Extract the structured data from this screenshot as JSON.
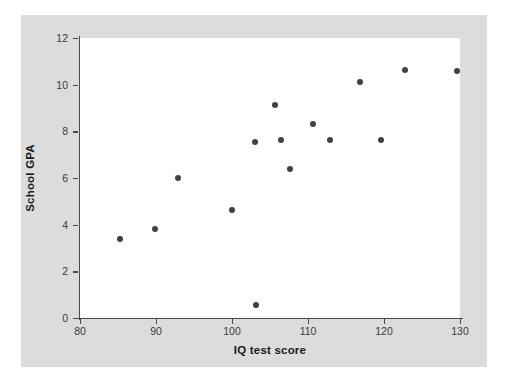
{
  "chart_data": {
    "type": "scatter",
    "title": "",
    "xlabel": "IQ test score",
    "ylabel": "School GPA",
    "xlim": [
      80,
      130
    ],
    "ylim": [
      0,
      12
    ],
    "xticks": [
      80,
      90,
      100,
      110,
      120,
      130
    ],
    "yticks": [
      0,
      2,
      4,
      6,
      8,
      10,
      12
    ],
    "xtick_labels": [
      "80",
      "90",
      "100",
      "110",
      "120",
      "130"
    ],
    "ytick_labels": [
      "0",
      "2",
      "4",
      "6",
      "8",
      "10",
      "12"
    ],
    "grid": false,
    "legend": null,
    "marker_color": "#414141",
    "panel_color": "#ffffff",
    "background_color": "#dcdcdc",
    "axis_color": "#4a4a4a",
    "points": [
      {
        "x": 85.3,
        "y": 3.4
      },
      {
        "x": 89.9,
        "y": 3.8
      },
      {
        "x": 92.9,
        "y": 6.0
      },
      {
        "x": 100.0,
        "y": 4.65
      },
      {
        "x": 103.0,
        "y": 7.55
      },
      {
        "x": 103.1,
        "y": 0.55
      },
      {
        "x": 105.7,
        "y": 9.15
      },
      {
        "x": 106.5,
        "y": 7.65
      },
      {
        "x": 107.6,
        "y": 6.4
      },
      {
        "x": 110.7,
        "y": 8.3
      },
      {
        "x": 112.9,
        "y": 7.65
      },
      {
        "x": 116.8,
        "y": 10.1
      },
      {
        "x": 119.6,
        "y": 7.65
      },
      {
        "x": 122.8,
        "y": 10.65
      },
      {
        "x": 129.6,
        "y": 10.6
      }
    ]
  }
}
